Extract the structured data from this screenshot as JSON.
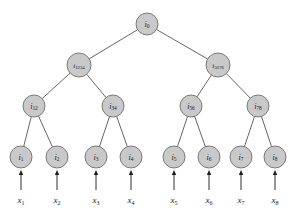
{
  "figure": {
    "type": "binary-tree-diagram",
    "title": "",
    "background_color": "#ffffff",
    "node_fill": "#c9c9c9",
    "node_stroke": "#6f6f6f",
    "edge_color": "#555555",
    "text_color": "#1a1a1a"
  },
  "nodes": [
    {
      "id": "i0",
      "base": "i",
      "sub": "0",
      "x": 147,
      "y": 24,
      "r": 11,
      "level": 0,
      "size": "normal"
    },
    {
      "id": "i1234",
      "base": "i",
      "sub": "1234",
      "x": 79,
      "y": 65,
      "r": 12,
      "level": 1,
      "size": "small"
    },
    {
      "id": "i5678",
      "base": "i",
      "sub": "5678",
      "x": 218,
      "y": 65,
      "r": 12,
      "level": 1,
      "size": "small"
    },
    {
      "id": "i12",
      "base": "i",
      "sub": "12",
      "x": 34,
      "y": 106,
      "r": 11,
      "level": 2,
      "size": "normal"
    },
    {
      "id": "i34",
      "base": "i",
      "sub": "34",
      "x": 113,
      "y": 106,
      "r": 11,
      "level": 2,
      "size": "normal"
    },
    {
      "id": "i56",
      "base": "i",
      "sub": "56",
      "x": 191,
      "y": 106,
      "r": 11,
      "level": 2,
      "size": "normal"
    },
    {
      "id": "i78",
      "base": "i",
      "sub": "78",
      "x": 258,
      "y": 106,
      "r": 11,
      "level": 2,
      "size": "normal"
    },
    {
      "id": "i1",
      "base": "i",
      "sub": "1",
      "x": 21,
      "y": 157,
      "r": 11,
      "level": 3,
      "size": "normal"
    },
    {
      "id": "i2",
      "base": "i",
      "sub": "2",
      "x": 57,
      "y": 157,
      "r": 11,
      "level": 3,
      "size": "normal"
    },
    {
      "id": "i3",
      "base": "i",
      "sub": "3",
      "x": 96,
      "y": 157,
      "r": 11,
      "level": 3,
      "size": "normal"
    },
    {
      "id": "i4",
      "base": "i",
      "sub": "4",
      "x": 131,
      "y": 157,
      "r": 11,
      "level": 3,
      "size": "normal"
    },
    {
      "id": "i5",
      "base": "i",
      "sub": "5",
      "x": 174,
      "y": 157,
      "r": 11,
      "level": 3,
      "size": "normal"
    },
    {
      "id": "i6",
      "base": "i",
      "sub": "6",
      "x": 209,
      "y": 157,
      "r": 11,
      "level": 3,
      "size": "normal"
    },
    {
      "id": "i7",
      "base": "i",
      "sub": "7",
      "x": 241,
      "y": 157,
      "r": 11,
      "level": 3,
      "size": "normal"
    },
    {
      "id": "i8",
      "base": "i",
      "sub": "8",
      "x": 275,
      "y": 157,
      "r": 11,
      "level": 3,
      "size": "normal"
    }
  ],
  "edges": [
    {
      "from": "i0",
      "to": "i1234"
    },
    {
      "from": "i0",
      "to": "i5678"
    },
    {
      "from": "i1234",
      "to": "i12"
    },
    {
      "from": "i1234",
      "to": "i34"
    },
    {
      "from": "i5678",
      "to": "i56"
    },
    {
      "from": "i5678",
      "to": "i78"
    },
    {
      "from": "i12",
      "to": "i1"
    },
    {
      "from": "i12",
      "to": "i2"
    },
    {
      "from": "i34",
      "to": "i3"
    },
    {
      "from": "i34",
      "to": "i4"
    },
    {
      "from": "i56",
      "to": "i5"
    },
    {
      "from": "i56",
      "to": "i6"
    },
    {
      "from": "i78",
      "to": "i7"
    },
    {
      "from": "i78",
      "to": "i8"
    }
  ],
  "inputs": [
    {
      "id": "x1",
      "base": "x",
      "sub": "1",
      "x": 21,
      "label_y": 201,
      "arrow_to": "i1"
    },
    {
      "id": "x2",
      "base": "x",
      "sub": "2",
      "x": 57,
      "label_y": 201,
      "arrow_to": "i2"
    },
    {
      "id": "x3",
      "base": "x",
      "sub": "3",
      "x": 96,
      "label_y": 201,
      "arrow_to": "i3"
    },
    {
      "id": "x4",
      "base": "x",
      "sub": "4",
      "x": 131,
      "label_y": 201,
      "arrow_to": "i4"
    },
    {
      "id": "x5",
      "base": "x",
      "sub": "5",
      "x": 174,
      "label_y": 201,
      "arrow_to": "i5"
    },
    {
      "id": "x6",
      "base": "x",
      "sub": "6",
      "x": 209,
      "label_y": 201,
      "arrow_to": "i6"
    },
    {
      "id": "x7",
      "base": "x",
      "sub": "7",
      "x": 241,
      "label_y": 201,
      "arrow_to": "i7"
    },
    {
      "id": "x8",
      "base": "x",
      "sub": "8",
      "x": 275,
      "label_y": 201,
      "arrow_to": "i8"
    }
  ],
  "arrow_geometry": {
    "tail_y": 190,
    "head_y": 170,
    "head_width": 4.4,
    "head_length": 5.0
  }
}
